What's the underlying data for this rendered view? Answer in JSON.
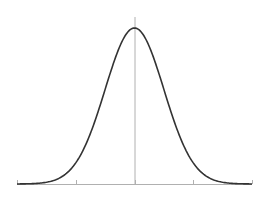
{
  "chart_data": {
    "type": "line",
    "title": "",
    "xlabel": "",
    "ylabel": "",
    "mean": 0,
    "std": 1,
    "xlim": [
      -4,
      4
    ],
    "ylim": [
      0,
      0.4
    ],
    "x_ticks": [
      -4,
      -2,
      0,
      2,
      4
    ],
    "tick_labels": [],
    "grid": false,
    "legend": null,
    "series": [
      {
        "name": "normal-density",
        "x": [
          -4,
          -3.5,
          -3,
          -2.5,
          -2,
          -1.5,
          -1,
          -0.5,
          0,
          0.5,
          1,
          1.5,
          2,
          2.5,
          3,
          3.5,
          4
        ],
        "values": [
          0.0001,
          0.0009,
          0.0044,
          0.0175,
          0.054,
          0.1295,
          0.242,
          0.3521,
          0.3989,
          0.3521,
          0.242,
          0.1295,
          0.054,
          0.0175,
          0.0044,
          0.0009,
          0.0001
        ]
      }
    ],
    "colors": {
      "curve": "#333333",
      "axis": "#b0b0b0"
    }
  }
}
